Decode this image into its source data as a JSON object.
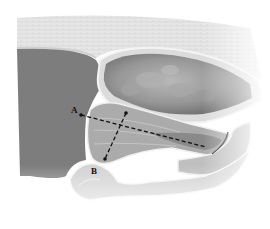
{
  "figure": {
    "labels": [
      {
        "id": "A",
        "text": "A"
      },
      {
        "id": "B",
        "text": "B"
      }
    ],
    "colors": {
      "background": "#ffffff",
      "skin_layer": "#e4e4e4",
      "dark_tissue": "#7a7a7a",
      "organ_fill": "#8c8c8c",
      "organ_highlight": "#b5b5b5",
      "muscle_layers": "#a9a9a9",
      "outline": "#f2f2f2",
      "marker": "#111111"
    }
  }
}
